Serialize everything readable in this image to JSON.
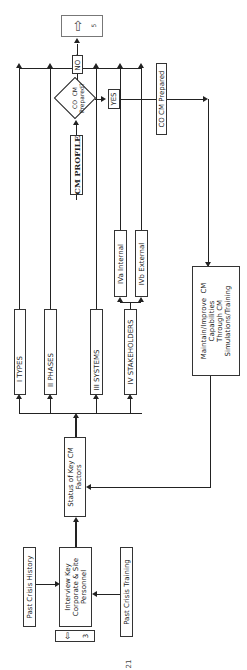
{
  "diagram": {
    "orientation": "rotated-90-ccw",
    "nodes": {
      "past_crisis_history": "Past  Crisis  History",
      "past_crisis_training": "Past  Crisis  Training",
      "interview": "Interview Key\nCorporate & Site\nPersonnel",
      "connector_in": "3",
      "status": "Status of Key CM\nFactors",
      "types": "I TYPES",
      "phases": "II PHASES",
      "systems": "III SYSTEMS",
      "stakeholders": "IV  STAKEHOLDERS",
      "internal": "IVa  Internal",
      "external": "IVb  External",
      "profile": "CM PROFILE",
      "decision": "CO  CM\nPrepared?",
      "no": "NO",
      "yes": "YES",
      "connector_out": "5",
      "prepared": "CO  CM  Prepared",
      "maintain": "Maintain/Improve  CM\nCapabilities\nThrough CM\nSimulations/Training"
    },
    "page_number": "21"
  }
}
